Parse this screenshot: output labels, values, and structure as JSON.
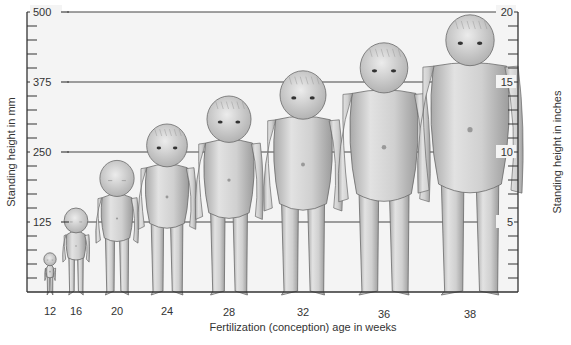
{
  "chart_data": {
    "type": "bar",
    "title": "",
    "xlabel": "Fertilization (conception) age in weeks",
    "ylabel": "Standing height in mm",
    "ylabel_right": "Standing height in inches",
    "categories": [
      "12",
      "16",
      "20",
      "24",
      "28",
      "32",
      "36",
      "38"
    ],
    "values": [
      70,
      150,
      235,
      300,
      350,
      395,
      445,
      495
    ],
    "units": "mm",
    "ylim": [
      0,
      500
    ],
    "yticks": [
      125,
      250,
      375,
      500
    ],
    "yminor_step": 25,
    "ylim_right": [
      0,
      20
    ],
    "yticks_right": [
      5,
      10,
      15,
      20
    ],
    "yminor_step_right": 1,
    "grid": true,
    "grid_lines_at": [
      125,
      250,
      375,
      500
    ],
    "legend": null,
    "markers": "fetal-figure-illustrations",
    "colors": {
      "background": "#f4f4f4",
      "frame": "#333333",
      "grid": "#444444",
      "figure_fill": "#c9c9c9",
      "figure_highlight": "#e6e6e6",
      "figure_outline": "#6a6a6a"
    }
  }
}
